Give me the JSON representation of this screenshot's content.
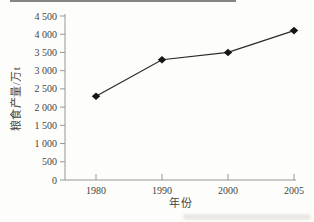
{
  "figure": {
    "background": "#fdfdfb"
  },
  "chart_data": {
    "type": "line",
    "title": "",
    "categories": [
      "1980",
      "1990",
      "2000",
      "2005"
    ],
    "values": [
      2300,
      3300,
      3500,
      4100
    ],
    "series": [
      {
        "name": "粮食产量",
        "values": [
          2300,
          3300,
          3500,
          4100
        ]
      }
    ],
    "xlabel": "年份",
    "ylabel": "粮食产量/万t",
    "ylim": [
      0,
      4500
    ],
    "ytick_step": 500,
    "ytick_labels": [
      "0",
      "500",
      "1 000",
      "1 500",
      "2 000",
      "2 500",
      "3 000",
      "3 500",
      "4 000",
      "4 500"
    ],
    "grid": false,
    "legend_position": "none",
    "marker": "diamond",
    "line_color": "#2b2a28",
    "marker_color": "#171613",
    "axis_color": "#9a978c",
    "text_color": "#45443f"
  }
}
